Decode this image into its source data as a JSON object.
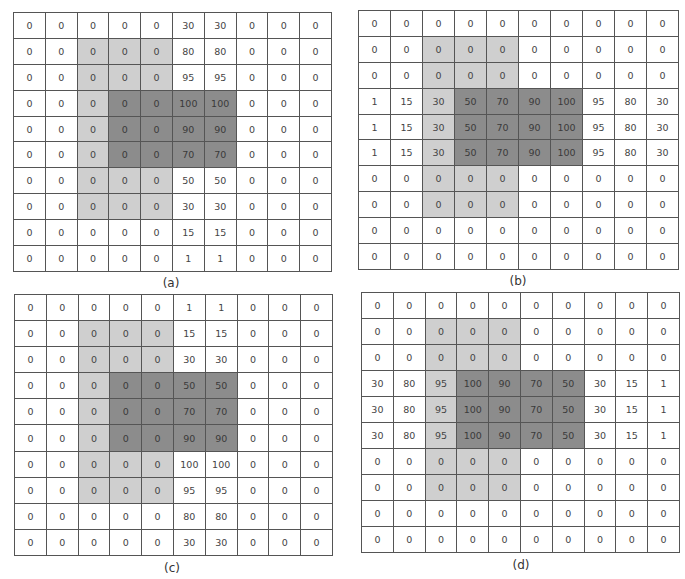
{
  "figure": {
    "colors": {
      "light_region": "#cfcfcf",
      "dark_region": "#8c8c8c",
      "background": "#ffffff",
      "grid_line": "#555555"
    },
    "panels": [
      {
        "id": "a",
        "label": "(a)",
        "light_region": {
          "rows": [
            1,
            7
          ],
          "cols": [
            2,
            4
          ]
        },
        "dark_region": {
          "rows": [
            3,
            5
          ],
          "cols": [
            3,
            6
          ]
        },
        "values": [
          [
            0,
            0,
            0,
            0,
            0,
            30,
            30,
            0,
            0,
            0
          ],
          [
            0,
            0,
            0,
            0,
            0,
            80,
            80,
            0,
            0,
            0
          ],
          [
            0,
            0,
            0,
            0,
            0,
            95,
            95,
            0,
            0,
            0
          ],
          [
            0,
            0,
            0,
            0,
            0,
            100,
            100,
            0,
            0,
            0
          ],
          [
            0,
            0,
            0,
            0,
            0,
            90,
            90,
            0,
            0,
            0
          ],
          [
            0,
            0,
            0,
            0,
            0,
            70,
            70,
            0,
            0,
            0
          ],
          [
            0,
            0,
            0,
            0,
            0,
            50,
            50,
            0,
            0,
            0
          ],
          [
            0,
            0,
            0,
            0,
            0,
            30,
            30,
            0,
            0,
            0
          ],
          [
            0,
            0,
            0,
            0,
            0,
            15,
            15,
            0,
            0,
            0
          ],
          [
            0,
            0,
            0,
            0,
            0,
            1,
            1,
            0,
            0,
            0
          ]
        ]
      },
      {
        "id": "b",
        "label": "(b)",
        "light_region": {
          "rows": [
            1,
            7
          ],
          "cols": [
            2,
            4
          ]
        },
        "dark_region": {
          "rows": [
            3,
            5
          ],
          "cols": [
            3,
            6
          ]
        },
        "values": [
          [
            0,
            0,
            0,
            0,
            0,
            0,
            0,
            0,
            0,
            0
          ],
          [
            0,
            0,
            0,
            0,
            0,
            0,
            0,
            0,
            0,
            0
          ],
          [
            0,
            0,
            0,
            0,
            0,
            0,
            0,
            0,
            0,
            0
          ],
          [
            1,
            15,
            30,
            50,
            70,
            90,
            100,
            95,
            80,
            30
          ],
          [
            1,
            15,
            30,
            50,
            70,
            90,
            100,
            95,
            80,
            30
          ],
          [
            1,
            15,
            30,
            50,
            70,
            90,
            100,
            95,
            80,
            30
          ],
          [
            0,
            0,
            0,
            0,
            0,
            0,
            0,
            0,
            0,
            0
          ],
          [
            0,
            0,
            0,
            0,
            0,
            0,
            0,
            0,
            0,
            0
          ],
          [
            0,
            0,
            0,
            0,
            0,
            0,
            0,
            0,
            0,
            0
          ],
          [
            0,
            0,
            0,
            0,
            0,
            0,
            0,
            0,
            0,
            0
          ]
        ]
      },
      {
        "id": "c",
        "label": "(c)",
        "light_region": {
          "rows": [
            1,
            7
          ],
          "cols": [
            2,
            4
          ]
        },
        "dark_region": {
          "rows": [
            3,
            5
          ],
          "cols": [
            3,
            6
          ]
        },
        "values": [
          [
            0,
            0,
            0,
            0,
            0,
            1,
            1,
            0,
            0,
            0
          ],
          [
            0,
            0,
            0,
            0,
            0,
            15,
            15,
            0,
            0,
            0
          ],
          [
            0,
            0,
            0,
            0,
            0,
            30,
            30,
            0,
            0,
            0
          ],
          [
            0,
            0,
            0,
            0,
            0,
            50,
            50,
            0,
            0,
            0
          ],
          [
            0,
            0,
            0,
            0,
            0,
            70,
            70,
            0,
            0,
            0
          ],
          [
            0,
            0,
            0,
            0,
            0,
            90,
            90,
            0,
            0,
            0
          ],
          [
            0,
            0,
            0,
            0,
            0,
            100,
            100,
            0,
            0,
            0
          ],
          [
            0,
            0,
            0,
            0,
            0,
            95,
            95,
            0,
            0,
            0
          ],
          [
            0,
            0,
            0,
            0,
            0,
            80,
            80,
            0,
            0,
            0
          ],
          [
            0,
            0,
            0,
            0,
            0,
            30,
            30,
            0,
            0,
            0
          ]
        ]
      },
      {
        "id": "d",
        "label": "(d)",
        "light_region": {
          "rows": [
            1,
            7
          ],
          "cols": [
            2,
            4
          ]
        },
        "dark_region": {
          "rows": [
            3,
            5
          ],
          "cols": [
            3,
            6
          ]
        },
        "values": [
          [
            0,
            0,
            0,
            0,
            0,
            0,
            0,
            0,
            0,
            0
          ],
          [
            0,
            0,
            0,
            0,
            0,
            0,
            0,
            0,
            0,
            0
          ],
          [
            0,
            0,
            0,
            0,
            0,
            0,
            0,
            0,
            0,
            0
          ],
          [
            30,
            80,
            95,
            100,
            90,
            70,
            50,
            30,
            15,
            1
          ],
          [
            30,
            80,
            95,
            100,
            90,
            70,
            50,
            30,
            15,
            1
          ],
          [
            30,
            80,
            95,
            100,
            90,
            70,
            50,
            30,
            15,
            1
          ],
          [
            0,
            0,
            0,
            0,
            0,
            0,
            0,
            0,
            0,
            0
          ],
          [
            0,
            0,
            0,
            0,
            0,
            0,
            0,
            0,
            0,
            0
          ],
          [
            0,
            0,
            0,
            0,
            0,
            0,
            0,
            0,
            0,
            0
          ],
          [
            0,
            0,
            0,
            0,
            0,
            0,
            0,
            0,
            0,
            0
          ]
        ]
      }
    ]
  }
}
